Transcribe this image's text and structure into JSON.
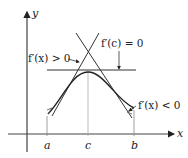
{
  "figure": {
    "type": "mean-value / critical-point illustration",
    "axes": {
      "x_label": "x",
      "y_label": "y"
    },
    "ticks": [
      {
        "label": "a",
        "px": 47
      },
      {
        "label": "c",
        "px": 88
      },
      {
        "label": "b",
        "px": 134
      }
    ],
    "annotations": {
      "left": "f′(x) > 0",
      "top": "f′(c) = 0",
      "right": "f′(x) < 0"
    },
    "colors": {
      "curve": "#333333",
      "axes": "#333333",
      "guides": "#999999"
    }
  }
}
